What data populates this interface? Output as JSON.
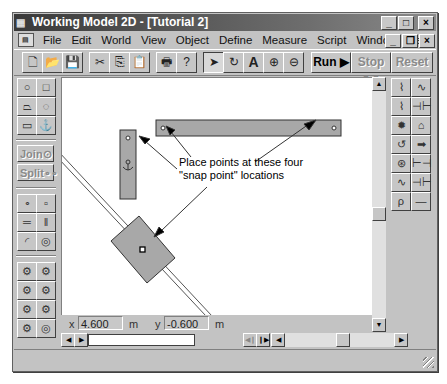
{
  "window": {
    "title": "Working Model 2D - [Tutorial 2]",
    "caption_buttons": {
      "minimize": "_",
      "maximize": "□",
      "close": "×"
    },
    "doc_caption_buttons": {
      "minimize": "_",
      "restore": "❐",
      "close": "×"
    }
  },
  "menubar": {
    "items": [
      {
        "label": "File"
      },
      {
        "label": "Edit"
      },
      {
        "label": "World"
      },
      {
        "label": "View"
      },
      {
        "label": "Object"
      },
      {
        "label": "Define"
      },
      {
        "label": "Measure"
      },
      {
        "label": "Script"
      },
      {
        "label": "Window"
      },
      {
        "label": "Help"
      }
    ]
  },
  "toolbar": {
    "icons": {
      "new": "🗋",
      "open": "📂",
      "save": "💾",
      "cut": "✂",
      "copy": "⎘",
      "paste": "📋",
      "print": "🖶",
      "help": "?",
      "arrow": "➤",
      "rotate": "↻",
      "text": "A",
      "zoom_in": "⊕",
      "zoom_out": "⊖"
    },
    "run_label": "Run ▶",
    "stop_label": "Stop ❚❚",
    "reset_label": "Reset"
  },
  "left_palette": {
    "shape_tools": [
      {
        "name": "circle",
        "glyph": "○"
      },
      {
        "name": "square",
        "glyph": "□"
      },
      {
        "name": "polygon",
        "glyph": "⏢"
      },
      {
        "name": "curved-body",
        "glyph": "◌"
      },
      {
        "name": "rectangle",
        "glyph": "▭"
      },
      {
        "name": "anchor",
        "glyph": "⚓"
      }
    ],
    "join_label": "Join⊙",
    "split_label": "Split∘∘",
    "constraint_tools": [
      {
        "name": "point",
        "glyph": "∘"
      },
      {
        "name": "square-point",
        "glyph": "▫"
      },
      {
        "name": "horizontal-slot",
        "glyph": "═"
      },
      {
        "name": "vertical-slot",
        "glyph": "‖"
      },
      {
        "name": "curved-slot",
        "glyph": "◜"
      },
      {
        "name": "keyed-slot",
        "glyph": "◎"
      }
    ],
    "joint_tools": [
      {
        "name": "pin-joint-1",
        "glyph": "⚙"
      },
      {
        "name": "pin-joint-2",
        "glyph": "⚙"
      },
      {
        "name": "slot-joint-1",
        "glyph": "⚙"
      },
      {
        "name": "slot-joint-2",
        "glyph": "⚙"
      },
      {
        "name": "rigid-joint-1",
        "glyph": "⚙"
      },
      {
        "name": "rigid-joint-2",
        "glyph": "⚙"
      },
      {
        "name": "keyed-joint-1",
        "glyph": "⚙"
      },
      {
        "name": "keyed-joint-2",
        "glyph": "◎"
      }
    ]
  },
  "right_palette": {
    "tools": [
      {
        "name": "rod-spring",
        "glyph": "⌇"
      },
      {
        "name": "spring",
        "glyph": "∿"
      },
      {
        "name": "spring-damper",
        "glyph": "⌇"
      },
      {
        "name": "damper",
        "glyph": "⊣⊢"
      },
      {
        "name": "gear",
        "glyph": "✹"
      },
      {
        "name": "pulley",
        "glyph": "⌂"
      },
      {
        "name": "motor",
        "glyph": "↺"
      },
      {
        "name": "force",
        "glyph": "➡"
      },
      {
        "name": "torque",
        "glyph": "⊛"
      },
      {
        "name": "actuator",
        "glyph": "⊢⊣"
      },
      {
        "name": "rotational-spring",
        "glyph": "∿"
      },
      {
        "name": "rotational-damper",
        "glyph": "⊣⊢"
      },
      {
        "name": "rope",
        "glyph": "ρ"
      },
      {
        "name": "separator",
        "glyph": "—"
      }
    ]
  },
  "canvas": {
    "annotation_line1": "Place points at these four",
    "annotation_line2": "\"snap point\" locations"
  },
  "coordinates": {
    "x_label": "x",
    "x_value": "4.600",
    "x_unit": "m",
    "y_label": "y",
    "y_value": "-0.600",
    "y_unit": "m"
  },
  "scrollbars": {
    "up": "▲",
    "down": "▼",
    "left": "◀",
    "right": "▶"
  },
  "tape_controls": {
    "rewind": "◀",
    "play": "▶",
    "step_back": "◀❙",
    "step_forward": "❙▶"
  }
}
